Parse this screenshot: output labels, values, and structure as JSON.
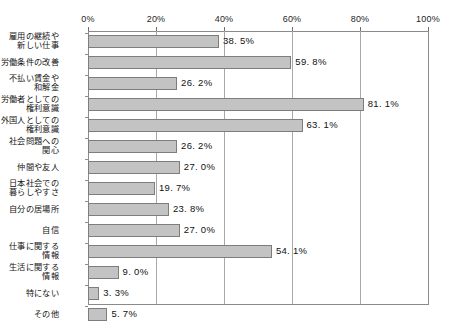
{
  "chart_data": {
    "type": "bar",
    "orientation": "horizontal",
    "title": "",
    "subtitle": "",
    "xlabel": "",
    "ylabel": "",
    "xlim": [
      0,
      100
    ],
    "xticks": [
      "0%",
      "20%",
      "40%",
      "60%",
      "80%",
      "100%"
    ],
    "xtick_values": [
      0,
      20,
      40,
      60,
      80,
      100
    ],
    "grid": "vertical",
    "legend": "none",
    "bar_color": "#c3c3c3",
    "bar_border_color": "#7d7d7d",
    "axis_color": "#8a8a8a",
    "gridline_color": "#a8a8a8",
    "value_label_suffix": "%",
    "categories": [
      "雇用の継続や\n新しい仕事",
      "労働条件の改善",
      "不払い賃金や\n和解金",
      "労働者としての\n権利意識",
      "外国人としての\n権利意識",
      "社会問題への\n関心",
      "仲間や友人",
      "日本社会での\n暮らしやすさ",
      "自分の居場所",
      "自信",
      "仕事に関する\n情報",
      "生活に関する\n情報",
      "特にない",
      "その他"
    ],
    "values": [
      38.5,
      59.8,
      26.2,
      81.1,
      63.1,
      26.2,
      27.0,
      19.7,
      23.8,
      27.0,
      54.1,
      9.0,
      3.3,
      5.7
    ],
    "value_labels": [
      "38. 5%",
      "59. 8%",
      "26. 2%",
      "81. 1%",
      "63. 1%",
      "26. 2%",
      "27. 0%",
      "19. 7%",
      "23. 8%",
      "27. 0%",
      "54. 1%",
      "9. 0%",
      "3. 3%",
      "5. 7%"
    ]
  }
}
